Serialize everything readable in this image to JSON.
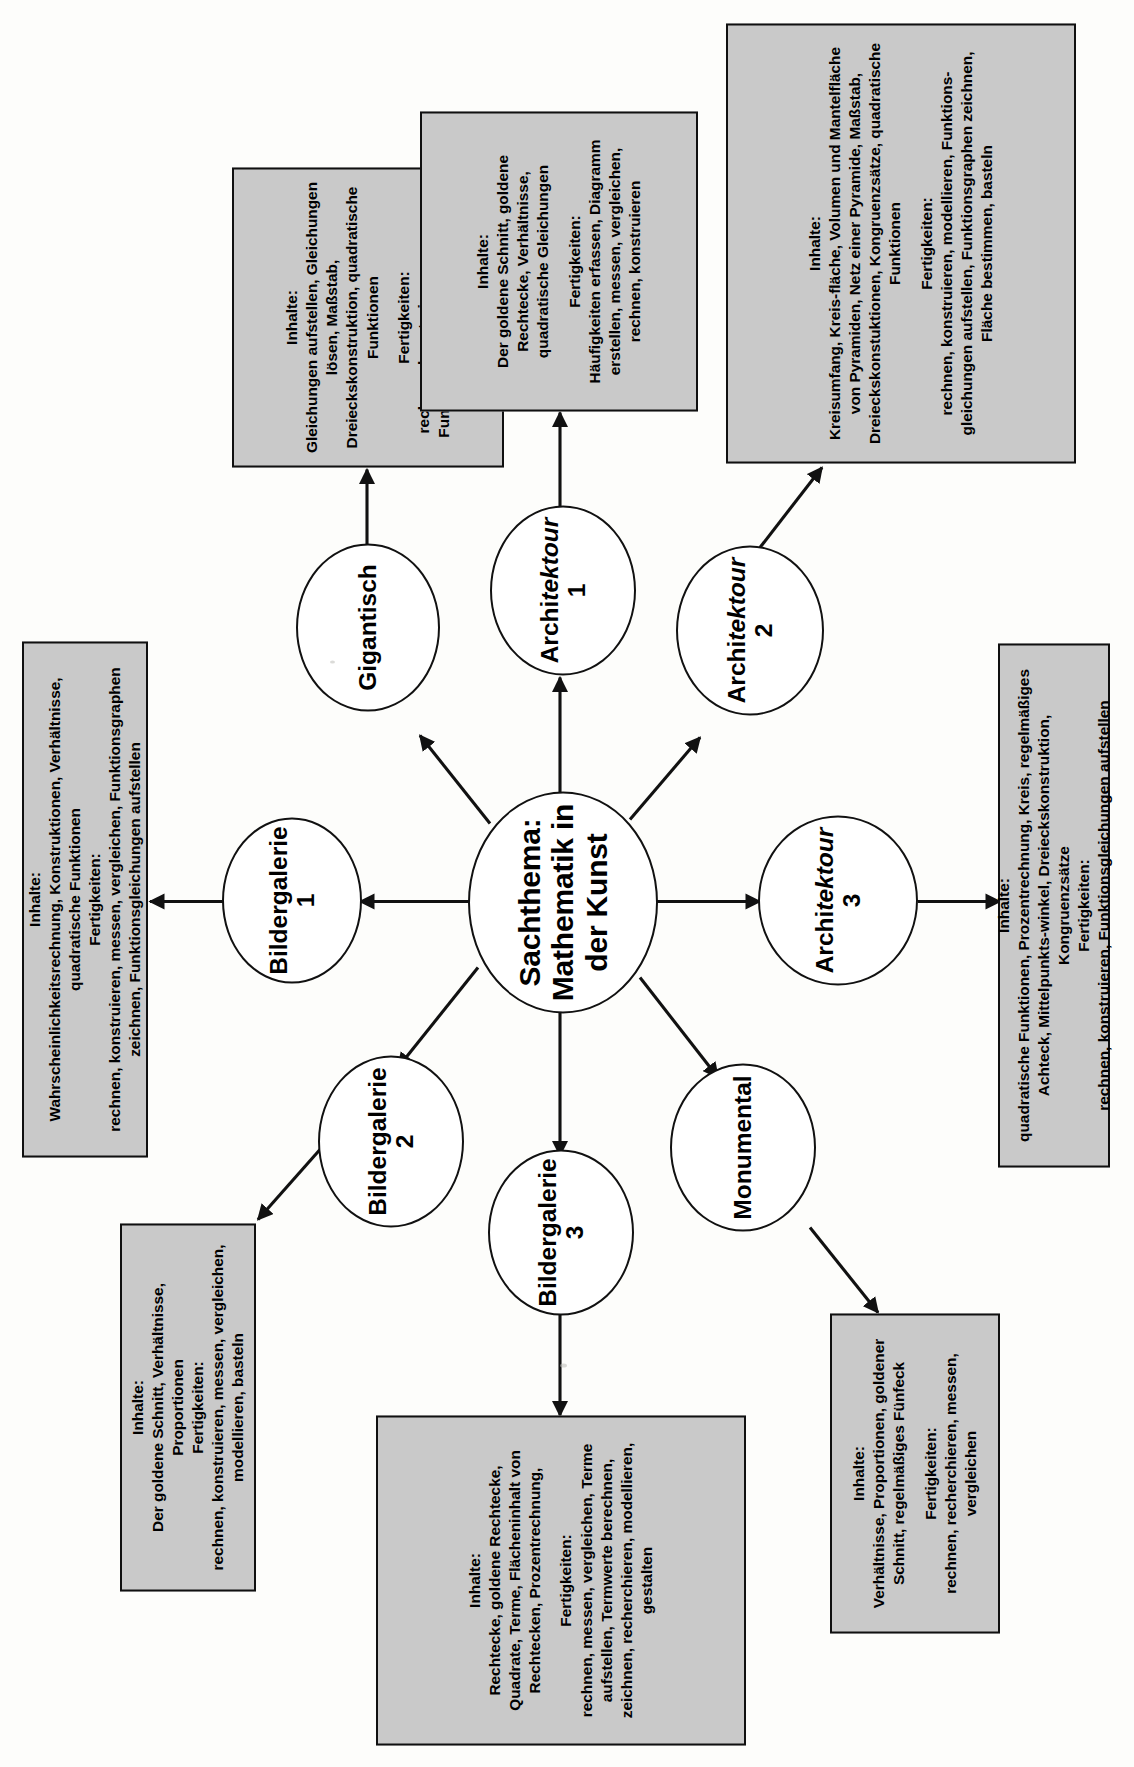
{
  "center": {
    "title_line1": "Sachthema:",
    "title_line2": "Mathematik in",
    "title_line3": "der Kunst"
  },
  "nodes": [
    {
      "id": "bildergalerie-1",
      "label": "Bildergalerie 1"
    },
    {
      "id": "bildergalerie-2",
      "label": "Bildergalerie 2"
    },
    {
      "id": "bildergalerie-3",
      "label": "Bildergalerie 3"
    },
    {
      "id": "monumental",
      "label": "Monumental"
    },
    {
      "id": "gigantisch",
      "label": "Gigantisch"
    },
    {
      "id": "architektour-1",
      "label_pre": "Archi",
      "label_it": "tektour",
      "label_post": " 1"
    },
    {
      "id": "architektour-2",
      "label_pre": "Archi",
      "label_it": "tektour",
      "label_post": " 2"
    },
    {
      "id": "architektour-3",
      "label_pre": "Archi",
      "label_it": "tektour",
      "label_post": " 3"
    }
  ],
  "boxes": {
    "goldener_schnitt": {
      "heading1": "Inhalte:",
      "body1": "Der goldene Schnitt, Verhältnisse, Proportionen",
      "heading2": "Fertigkeiten:",
      "body2": "rechnen, konstruieren, messen, vergleichen, modellieren, basteln"
    },
    "bildergalerie_3": {
      "heading1": "Inhalte:",
      "body1": "Rechtecke, goldene Rechtecke, Quadrate, Terme, Flächeninhalt von Rechtecken, Prozentrechnung,",
      "heading2": "Fertigkeiten:",
      "body2": "rechnen, messen, vergleichen, Terme aufstellen, Termwerte berechnen, zeichnen, recherchieren, modellieren, gestalten"
    },
    "monumental": {
      "heading1": "Inhalte:",
      "body1": "Verhältnisse, Proportionen, goldener Schnitt, regelmäßiges Fünfeck",
      "heading2": "Fertigkeiten:",
      "body2": "rechnen, recherchieren, messen, vergleichen"
    },
    "bildergalerie_1": {
      "heading1": "Inhalte:",
      "body1": "Wahrscheinlichkeitsrechnung, Konstruktionen, Verhältnisse, quadratische Funktionen",
      "heading2": "Fertigkeiten:",
      "body2": "rechnen, konstruieren, messen, vergleichen, Funktionsgraphen zeichnen, Funktionsgleichungen aufstellen"
    },
    "gigantisch": {
      "heading1": "Inhalte:",
      "body1": "Gleichungen aufstellen, Gleichungen lösen, Maßstab, Dreieckskonstruktion, quadratische Funktionen",
      "heading2": "Fertigkeiten:",
      "body2": "rechnen, konstruieren, messen, Funktionsgleichungen aufstellen"
    },
    "architektour_3": {
      "heading1": "Inhalte:",
      "body1": "quadratische Funktionen, Prozentrechnung, Kreis, regelmäßiges Achteck, Mittelpunkts-winkel, Dreieckskonstruktion, Kongruenzsätze",
      "heading2": "Fertigkeiten:",
      "body2": "rechnen, konstruieren, Funktionsgleichungen aufstellen"
    },
    "architektour_2": {
      "heading1": "Inhalte:",
      "body1": "Kreisumfang, Kreis-fläche, Volumen und Mantelfläche von Pyramiden, Netz einer Pyramide, Maßstab, Dreieckskonstuktionen, Kongruenzsätze, quadratische Funktionen",
      "heading2": "Fertigkeiten:",
      "body2": "rechnen, konstruieren, modellieren, Funktions-gleichungen aufstellen, Funktionsgraphen zeichnen, Fläche bestimmen, basteln"
    },
    "architektour_1": {
      "heading1": "Inhalte:",
      "body1": "Der goldene Schnitt, goldene Rechtecke, Verhältnisse, quadratische Gleichungen",
      "heading2": "Fertigkeiten:",
      "body2": "Häufigkeiten erfassen, Diagramm erstellen, messen, vergleichen, rechnen, konstruieren"
    }
  },
  "colors": {
    "box_fill": "#c9c9c9",
    "box_border": "#101010",
    "node_fill": "#ffffff",
    "node_border": "#111111",
    "page_bg": "#fdfdfb"
  }
}
